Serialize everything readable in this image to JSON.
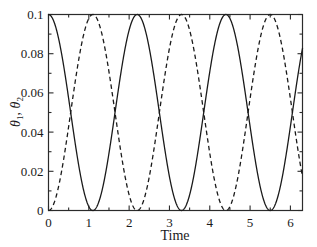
{
  "chart_data": {
    "type": "line",
    "title": "",
    "subtitle": "",
    "xlabel": "Time",
    "ylabel": "θ₁, θ₂",
    "xlim": [
      0,
      6.3
    ],
    "ylim": [
      0,
      0.1
    ],
    "grid": false,
    "legend": "none",
    "x_ticks": [
      0,
      1,
      2,
      3,
      4,
      5,
      6
    ],
    "x_tick_labels": [
      "0",
      "1",
      "2",
      "3",
      "4",
      "5",
      "6"
    ],
    "y_ticks": [
      0,
      0.02,
      0.04,
      0.06,
      0.08,
      0.1
    ],
    "y_tick_labels": [
      "0",
      "0.02",
      "0.04",
      "0.06",
      "0.08",
      "0.1"
    ],
    "beat_period": 2.2,
    "amplitude": 0.1,
    "series": [
      {
        "name": "θ₁",
        "style": "solid",
        "color": "#1a1a1a",
        "formula": "0.1*cos(pi*t/2.2)^2",
        "x": [
          0.0,
          0.1,
          0.2,
          0.3,
          0.4,
          0.5,
          0.6,
          0.7,
          0.8,
          0.9,
          1.0,
          1.1,
          1.2,
          1.3,
          1.4,
          1.5,
          1.6,
          1.7,
          1.8,
          1.9,
          2.0,
          2.1,
          2.2,
          2.3,
          2.4,
          2.5,
          2.6,
          2.7,
          2.8,
          2.9,
          3.0,
          3.1,
          3.2,
          3.3,
          3.4,
          3.5,
          3.6,
          3.7,
          3.8,
          3.9,
          4.0,
          4.1,
          4.2,
          4.3,
          4.4,
          4.5,
          4.6,
          4.7,
          4.8,
          4.9,
          5.0,
          5.1,
          5.2,
          5.3,
          5.4,
          5.5,
          5.6,
          5.7,
          5.8,
          5.9,
          6.0,
          6.1,
          6.2,
          6.3
        ],
        "y": [
          0.1,
          0.098,
          0.092,
          0.0827,
          0.0709,
          0.0577,
          0.0442,
          0.0315,
          0.0204,
          0.0117,
          0.0057,
          0.002,
          0.0005,
          0.0013,
          0.0045,
          0.0099,
          0.0172,
          0.0261,
          0.0362,
          0.0469,
          0.0577,
          0.0681,
          0.0776,
          0.0857,
          0.0921,
          0.0965,
          0.099,
          0.0995,
          0.098,
          0.0945,
          0.0892,
          0.0824,
          0.0744,
          0.0656,
          0.0562,
          0.0467,
          0.0374,
          0.0286,
          0.0206,
          0.0138,
          0.0082,
          0.004,
          0.0014,
          0.0002,
          0.0005,
          0.0024,
          0.0058,
          0.0106,
          0.0165,
          0.0234,
          0.031,
          0.039,
          0.0472,
          0.0554,
          0.0633,
          0.0707,
          0.0774,
          0.0833,
          0.0881,
          0.0919,
          0.0945,
          0.0959,
          0.0962,
          0.0952
        ]
      },
      {
        "name": "θ₂",
        "style": "dashed",
        "color": "#1a1a1a",
        "formula": "0.1*sin(pi*t/2.2)^2",
        "x": [
          0.0,
          0.1,
          0.2,
          0.3,
          0.4,
          0.5,
          0.6,
          0.7,
          0.8,
          0.9,
          1.0,
          1.1,
          1.2,
          1.3,
          1.4,
          1.5,
          1.6,
          1.7,
          1.8,
          1.9,
          2.0,
          2.1,
          2.2,
          2.3,
          2.4,
          2.5,
          2.6,
          2.7,
          2.8,
          2.9,
          3.0,
          3.1,
          3.2,
          3.3,
          3.4,
          3.5,
          3.6,
          3.7,
          3.8,
          3.9,
          4.0,
          4.1,
          4.2,
          4.3,
          4.4,
          4.5,
          4.6,
          4.7,
          4.8,
          4.9,
          5.0,
          5.1,
          5.2,
          5.3,
          5.4,
          5.5,
          5.6,
          5.7,
          5.8,
          5.9,
          6.0,
          6.1,
          6.2,
          6.3
        ],
        "y": [
          0.0,
          0.002,
          0.008,
          0.0173,
          0.0291,
          0.0423,
          0.0558,
          0.0685,
          0.0796,
          0.0883,
          0.0943,
          0.098,
          0.0995,
          0.0987,
          0.0955,
          0.0901,
          0.0828,
          0.0739,
          0.0638,
          0.0531,
          0.0423,
          0.0319,
          0.0224,
          0.0143,
          0.0079,
          0.0035,
          0.001,
          0.0005,
          0.002,
          0.0055,
          0.0108,
          0.0176,
          0.0256,
          0.0344,
          0.0438,
          0.0533,
          0.0626,
          0.0714,
          0.0794,
          0.0862,
          0.0918,
          0.096,
          0.0986,
          0.0998,
          0.0995,
          0.0976,
          0.0942,
          0.0894,
          0.0835,
          0.0766,
          0.069,
          0.061,
          0.0528,
          0.0446,
          0.0367,
          0.0293,
          0.0226,
          0.0167,
          0.0119,
          0.0081,
          0.0055,
          0.0041,
          0.0038,
          0.0048
        ]
      }
    ]
  },
  "axes": {
    "x_title": "Time",
    "y_title_theta": "θ",
    "y_title_sub1": "1",
    "y_title_sub2": "2",
    "y_title_sep": ", "
  }
}
